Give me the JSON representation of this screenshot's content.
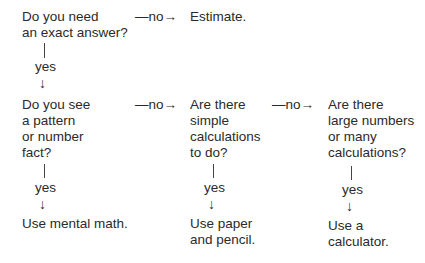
{
  "flowchart": {
    "q1": "Do you need\nan exact answer?",
    "q1_no": "—no→",
    "estimate": "Estimate.",
    "q1_yes": "yes",
    "q2": "Do you see\na pattern\nor number\nfact?",
    "q2_no": "—no→",
    "q3": "Are there\nsimple\ncalculations\nto do?",
    "q3_no": "—no→",
    "q4": "Are there\nlarge numbers\nor many\ncalculations?",
    "q2_yes": "yes",
    "q3_yes": "yes",
    "q4_yes": "yes",
    "mental": "Use mental math.",
    "paper": "Use paper\nand pencil.",
    "calculator": "Use a\ncalculator.",
    "down_arrow": "↓"
  }
}
